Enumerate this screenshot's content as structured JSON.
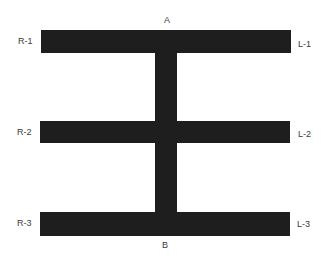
{
  "diagram": {
    "bar_color": "#1e1e1e",
    "top_label": "A",
    "bottom_label": "B",
    "left_labels": [
      "R-1",
      "R-2",
      "R-3"
    ],
    "right_labels": [
      "L-1",
      "L-2",
      "L-3"
    ]
  }
}
